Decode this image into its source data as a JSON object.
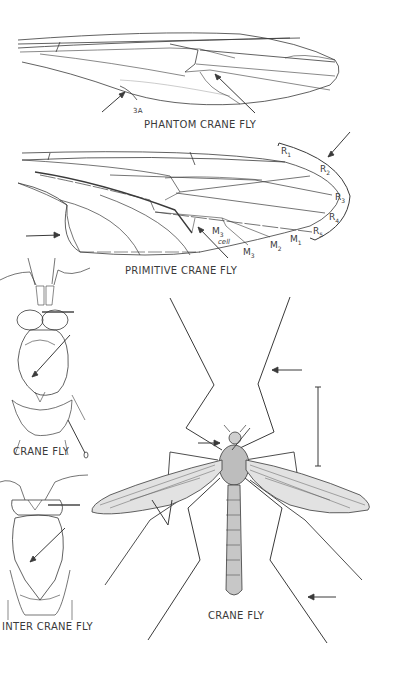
{
  "figure": {
    "panels": [
      {
        "id": "phantom-crane-fly-wing",
        "caption": "PHANTOM CRANE FLY",
        "annotations": [
          {
            "label": "3A"
          }
        ]
      },
      {
        "id": "primitive-crane-fly-wing",
        "caption": "PRIMITIVE CRANE FLY",
        "vein_labels": {
          "r1": "R",
          "r1_sub": "1",
          "r2": "R",
          "r2_sub": "2",
          "r3": "R",
          "r3_sub": "3",
          "r4": "R",
          "r4_sub": "4",
          "r5": "R",
          "r5_sub": "5",
          "m1": "M",
          "m1_sub": "1",
          "m2": "M",
          "m2_sub": "2",
          "m3": "M",
          "m3_sub": "3",
          "m3cell": "M",
          "m3cell_sub": "3",
          "cell": "cell"
        }
      },
      {
        "id": "crane-fly-thorax",
        "caption": "CRANE FLY"
      },
      {
        "id": "winter-crane-fly-thorax",
        "caption": "INTER CRANE FLY"
      },
      {
        "id": "crane-fly-full-body",
        "caption": "CRANE FLY"
      }
    ],
    "colors": {
      "ink": "#3a3a3a",
      "background": "#ffffff"
    }
  }
}
